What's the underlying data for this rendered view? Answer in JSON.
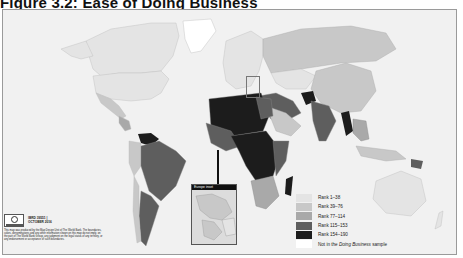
{
  "figure": {
    "title": "Figure 3.2:   Ease of Doing Business"
  },
  "legend": {
    "items": [
      {
        "label": "Rank 1–38",
        "color": "#e4e4e4"
      },
      {
        "label": "Rank 39–76",
        "color": "#c8c8c8"
      },
      {
        "label": "Rank 77–114",
        "color": "#a9a9a9"
      },
      {
        "label": "Rank 115–153",
        "color": "#5e5e5e"
      },
      {
        "label": "Rank 154–190",
        "color": "#1c1c1c"
      }
    ],
    "not_in_sample": {
      "prefix": "Not in the ",
      "italic": "Doing Business",
      "suffix": " sample",
      "color": "#ffffff"
    }
  },
  "inset": {
    "title": "Europe inset"
  },
  "credit": {
    "code": "IBRD 39551 |",
    "date": "OCTOBER 2016",
    "disclaimer": "This map was produced by the Map Design Unit of The World Bank. The boundaries, colors, denominations and any other information shown on this map do not imply, on the part of The World Bank Group, any judgment on the legal status of any territory, or any endorsement or acceptance of such boundaries."
  },
  "colors": {
    "ocean": "#f1f1f1",
    "rank1": "#e4e4e4",
    "rank2": "#c8c8c8",
    "rank3": "#a9a9a9",
    "rank4": "#5e5e5e",
    "rank5": "#1c1c1c",
    "none": "#ffffff"
  }
}
